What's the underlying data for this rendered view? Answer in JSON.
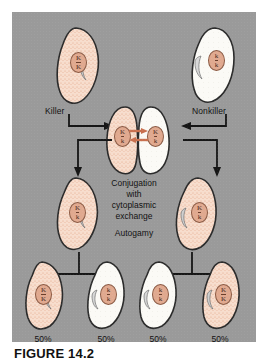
{
  "figure": {
    "caption": "FIGURE 14.2",
    "panel_background": "#9a9a9a",
    "killer_cell_color": "#f4d8c8",
    "nonkiller_cell_color": "#fbfbf8",
    "nucleus_color": "#e0a98f",
    "exchange_arrow_color": "#c8704f"
  },
  "labels": {
    "killer": "Killer",
    "nonkiller": "Nonkiller",
    "conjugation_line1": "Conjugation",
    "conjugation_line2": "with",
    "conjugation_line3": "cytoplasmic",
    "conjugation_line4": "exchange",
    "autogamy": "Autogamy"
  },
  "cells": {
    "parent_left": {
      "genotype_top": "K",
      "genotype_bottom": "K",
      "type": "killer"
    },
    "parent_right": {
      "genotype_top": "k",
      "genotype_bottom": "k",
      "type": "nonkiller"
    },
    "conjugant_left": {
      "genotype_top": "K",
      "genotype_bottom": "k",
      "type": "killer"
    },
    "conjugant_right": {
      "genotype_top": "K",
      "genotype_bottom": "k",
      "type": "nonkiller"
    },
    "exconjugant_left": {
      "genotype_top": "K",
      "genotype_bottom": "k",
      "type": "killer"
    },
    "exconjugant_right": {
      "genotype_top": "K",
      "genotype_bottom": "k",
      "type": "killer"
    },
    "offspring_1": {
      "genotype_top": "K",
      "genotype_bottom": "K",
      "type": "killer"
    },
    "offspring_2": {
      "genotype_top": "k",
      "genotype_bottom": "k",
      "type": "nonkiller"
    },
    "offspring_3": {
      "genotype_top": "k",
      "genotype_bottom": "k",
      "type": "nonkiller"
    },
    "offspring_4": {
      "genotype_top": "K",
      "genotype_bottom": "K",
      "type": "killer"
    }
  },
  "percentages": {
    "offspring_1": "50%",
    "offspring_2": "50%",
    "offspring_3": "50%",
    "offspring_4": "50%"
  }
}
